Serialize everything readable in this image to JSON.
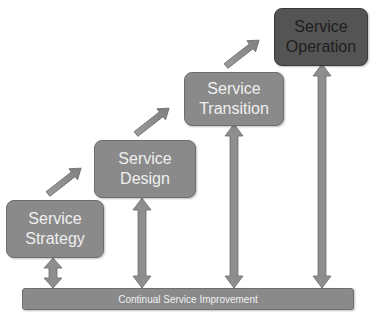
{
  "diagram": {
    "stages": [
      {
        "line1": "Service",
        "line2": "Strategy"
      },
      {
        "line1": "Service",
        "line2": "Design"
      },
      {
        "line1": "Service",
        "line2": "Transition"
      },
      {
        "line1": "Service",
        "line2": "Operation"
      }
    ],
    "foundation": {
      "label": "Continual Service Improvement"
    },
    "colors": {
      "box": "#8a8a8a",
      "highlight_box": "#545454",
      "arrow": "#8e8e8e",
      "text_light": "#efefef",
      "text_dark": "#1e1e1e"
    }
  }
}
